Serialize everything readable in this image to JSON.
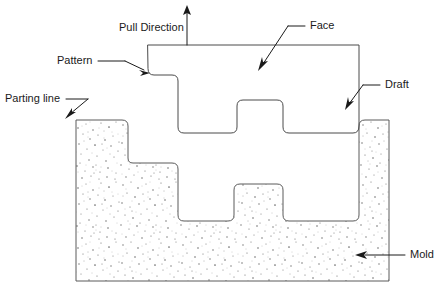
{
  "figure": {
    "background_color": "#ffffff",
    "line_color": "#4a4a4a",
    "text_color": "#1a1a1a",
    "width": 438,
    "height": 290
  },
  "labels": {
    "pull_direction": "Pull Direction",
    "pattern": "Pattern",
    "parting_line": "Parting line",
    "face": "Face",
    "draft": "Draft",
    "mold": "Mold"
  }
}
